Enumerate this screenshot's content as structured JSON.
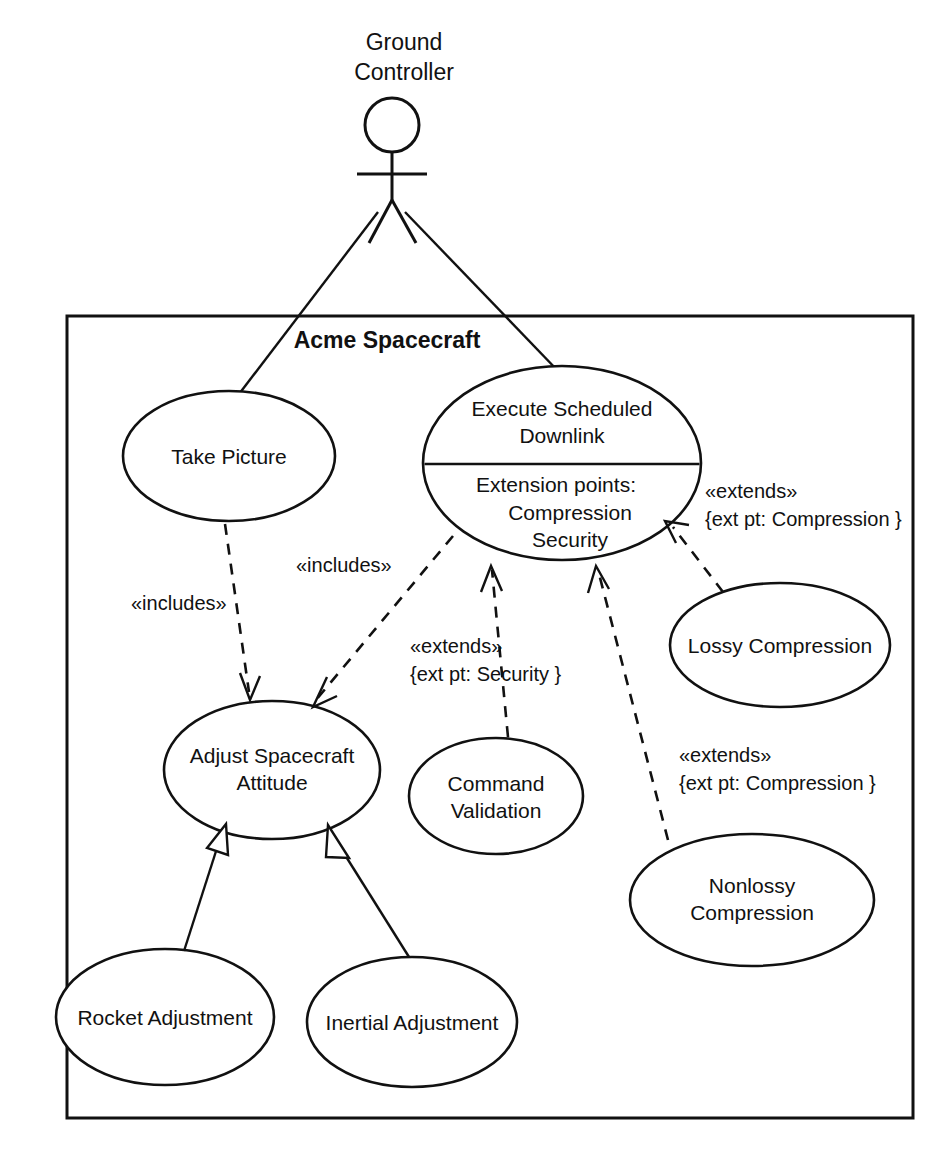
{
  "diagram": {
    "type": "uml-use-case-diagram",
    "stroke_color": "#111111",
    "background_color": "#ffffff"
  },
  "actor": {
    "name_line1": "Ground",
    "name_line2": "Controller",
    "icon": "stick-figure-actor-icon"
  },
  "system_boundary": {
    "label": "Acme Spacecraft"
  },
  "use_cases": {
    "take_picture": {
      "label": "Take Picture"
    },
    "execute_scheduled_downlink": {
      "name_line1": "Execute Scheduled",
      "name_line2": "Downlink",
      "extension_header": "Extension points:",
      "extension_point_1": "Compression",
      "extension_point_2": "Security"
    },
    "adjust_spacecraft_attitude": {
      "name_line1": "Adjust Spacecraft",
      "name_line2": "Attitude"
    },
    "command_validation": {
      "name_line1": "Command",
      "name_line2": "Validation"
    },
    "lossy_compression": {
      "label": "Lossy Compression"
    },
    "nonlossy_compression": {
      "name_line1": "Nonlossy",
      "name_line2": "Compression"
    },
    "rocket_adjustment": {
      "label": "Rocket Adjustment"
    },
    "inertial_adjustment": {
      "label": "Inertial Adjustment"
    }
  },
  "relationships": {
    "includes_take_picture": {
      "stereotype": "«includes»"
    },
    "includes_downlink": {
      "stereotype": "«includes»"
    },
    "extends_security": {
      "stereotype": "«extends»",
      "condition": "{ext pt: Security }"
    },
    "extends_compression_lossy": {
      "stereotype": "«extends»",
      "condition": "{ext pt: Compression }"
    },
    "extends_compression_nonlossy": {
      "stereotype": "«extends»",
      "condition": "{ext pt: Compression }"
    }
  }
}
